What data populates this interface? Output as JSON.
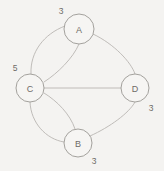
{
  "canvas": {
    "width": 164,
    "height": 171,
    "background": "#f4f3f1",
    "edge_color": "#b9b6b2",
    "node_stroke_color": "#9a9793",
    "node_fill_color": "#f6f5f3",
    "text_color": "#6e6b67"
  },
  "chart_data": {
    "type": "diagram",
    "diagram_kind": "multigraph",
    "title": "",
    "directed": false,
    "nodes": [
      {
        "id": "A",
        "label": "A",
        "degree_label": "3",
        "cx": 79,
        "cy": 29,
        "r": 15,
        "degree_label_x": 61,
        "degree_label_y": 11
      },
      {
        "id": "C",
        "label": "C",
        "degree_label": "5",
        "cx": 30,
        "cy": 88,
        "r": 14,
        "degree_label_x": 15,
        "degree_label_y": 68
      },
      {
        "id": "D",
        "label": "D",
        "degree_label": "3",
        "cx": 135,
        "cy": 88,
        "r": 14,
        "degree_label_x": 151,
        "degree_label_y": 108
      },
      {
        "id": "B",
        "label": "B",
        "degree_label": "3",
        "cx": 78,
        "cy": 143,
        "r": 14,
        "degree_label_x": 94,
        "degree_label_y": 161
      }
    ],
    "edges": [
      {
        "id": "CA-1",
        "source": "C",
        "target": "A",
        "multiplicity_index": 1,
        "path": "M 31 74 C 30 52 44 34 65 26"
      },
      {
        "id": "CA-2",
        "source": "C",
        "target": "A",
        "multiplicity_index": 2,
        "path": "M 44 82 C 58 73 73 58 79 44"
      },
      {
        "id": "CB-1",
        "source": "C",
        "target": "B",
        "multiplicity_index": 1,
        "path": "M 30 102 C 31 123 46 139 64 142"
      },
      {
        "id": "CB-2",
        "source": "C",
        "target": "B",
        "multiplicity_index": 2,
        "path": "M 44 93 C 57 101 70 114 75 129"
      },
      {
        "id": "CD-1",
        "source": "C",
        "target": "D",
        "multiplicity_index": 1,
        "path": "M 44 88 L 121 88"
      },
      {
        "id": "AD-1",
        "source": "A",
        "target": "D",
        "multiplicity_index": 1,
        "path": "M 93 34 C 114 44 131 62 135 74"
      },
      {
        "id": "BD-1",
        "source": "B",
        "target": "D",
        "multiplicity_index": 1,
        "path": "M 90 136 C 110 127 129 113 135 102"
      }
    ],
    "node_degrees": {
      "A": 3,
      "B": 3,
      "C": 5,
      "D": 3
    },
    "legend": [],
    "annotations": [
      {
        "text": "3",
        "near_node": "A",
        "position": "upper-left"
      },
      {
        "text": "5",
        "near_node": "C",
        "position": "upper-left"
      },
      {
        "text": "3",
        "near_node": "D",
        "position": "lower-right"
      },
      {
        "text": "3",
        "near_node": "B",
        "position": "lower-right"
      }
    ]
  }
}
